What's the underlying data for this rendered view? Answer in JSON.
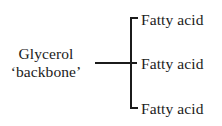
{
  "diagram": {
    "background_color": "#ffffff",
    "ink_color": "#1b1b1b",
    "glycerol": {
      "line1": "Glycerol",
      "line2": "‘backbone’"
    },
    "branches": [
      {
        "label": "Fatty acid"
      },
      {
        "label": "Fatty acid"
      },
      {
        "label": "Fatty acid"
      }
    ]
  }
}
